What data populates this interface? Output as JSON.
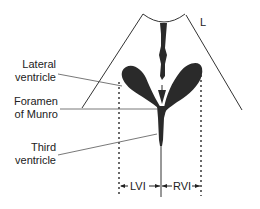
{
  "diagram": {
    "type": "anatomical-ultrasound-schematic",
    "corner_label": "L",
    "labels": {
      "lateral_ventricle": [
        "Lateral",
        "ventricle"
      ],
      "foramen_of_munro": [
        "Foramen",
        "of Munro"
      ],
      "third_ventricle": [
        "Third",
        "ventricle"
      ]
    },
    "measurements": {
      "left": "LVI",
      "right": "RVI"
    },
    "colors": {
      "ventricle_fill": "#2a2a2a",
      "line": "#333333",
      "background": "#ffffff"
    }
  }
}
